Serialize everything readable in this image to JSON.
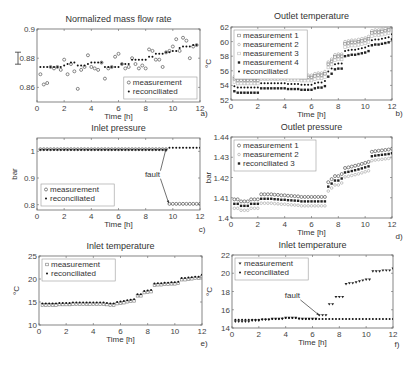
{
  "chart_data": [
    {
      "id": "a",
      "type": "scatter",
      "title": "Normalized mass flow rate",
      "xlabel": "Time [h]",
      "ylabel": "",
      "panel_label": "a)",
      "xlim": [
        0,
        12
      ],
      "ylim": [
        0.85,
        0.9
      ],
      "xticks": [
        0,
        2,
        4,
        6,
        8,
        10,
        12
      ],
      "yticks": [
        0.86,
        0.88,
        0.9
      ],
      "ytick_labels": [
        "0.86",
        "0.88",
        "0.9"
      ],
      "errorbar_marker": true,
      "legend": {
        "position": "bottom-right",
        "entries": [
          "measurement",
          "reconciliated"
        ]
      },
      "series": [
        {
          "name": "measurement",
          "marker": "open-circle",
          "x": [
            0.25,
            0.5,
            0.75,
            1.0,
            1.25,
            1.5,
            1.75,
            2.0,
            2.25,
            2.5,
            2.75,
            3.0,
            3.25,
            3.5,
            3.75,
            4.0,
            4.25,
            4.5,
            4.75,
            5.0,
            5.25,
            5.5,
            5.75,
            6.0,
            6.25,
            6.5,
            6.75,
            7.0,
            7.25,
            7.5,
            7.75,
            8.0,
            8.25,
            8.5,
            8.75,
            9.0,
            9.25,
            9.5,
            9.75,
            10.0,
            10.25,
            10.5,
            10.75,
            11.0,
            11.25,
            11.5,
            11.75
          ],
          "y": [
            0.869,
            0.862,
            0.863,
            0.874,
            0.873,
            0.874,
            0.872,
            0.879,
            0.869,
            0.876,
            0.871,
            0.859,
            0.872,
            0.874,
            0.882,
            0.874,
            0.873,
            0.872,
            0.877,
            0.866,
            0.873,
            0.874,
            0.881,
            0.883,
            0.876,
            0.873,
            0.874,
            0.88,
            0.876,
            0.873,
            0.875,
            0.873,
            0.886,
            0.885,
            0.879,
            0.879,
            0.874,
            0.884,
            0.885,
            0.888,
            0.893,
            0.885,
            0.894,
            0.892,
            0.88,
            0.888,
            0.889
          ]
        },
        {
          "name": "reconciliated",
          "marker": "filled-dot",
          "x": [
            0.25,
            0.5,
            0.75,
            1.0,
            1.25,
            1.5,
            1.75,
            2.0,
            2.25,
            2.5,
            2.75,
            3.0,
            3.25,
            3.5,
            3.75,
            4.0,
            4.25,
            4.5,
            4.75,
            5.0,
            5.25,
            5.5,
            5.75,
            6.0,
            6.25,
            6.5,
            6.75,
            7.0,
            7.25,
            7.5,
            7.75,
            8.0,
            8.25,
            8.5,
            8.75,
            9.0,
            9.25,
            9.5,
            9.75,
            10.0,
            10.25,
            10.5,
            10.75,
            11.0,
            11.25,
            11.5,
            11.75
          ],
          "y": [
            0.874,
            0.874,
            0.874,
            0.874,
            0.874,
            0.874,
            0.874,
            0.875,
            0.876,
            0.877,
            0.877,
            0.875,
            0.875,
            0.875,
            0.876,
            0.877,
            0.877,
            0.877,
            0.877,
            0.874,
            0.874,
            0.874,
            0.874,
            0.874,
            0.876,
            0.876,
            0.876,
            0.879,
            0.879,
            0.879,
            0.879,
            0.879,
            0.881,
            0.881,
            0.883,
            0.883,
            0.883,
            0.884,
            0.884,
            0.885,
            0.885,
            0.887,
            0.888,
            0.888,
            0.888,
            0.889,
            0.889
          ]
        }
      ]
    },
    {
      "id": "b",
      "type": "scatter",
      "title": "Outlet temperature",
      "xlabel": "Time [h]",
      "ylabel": "°C",
      "panel_label": "b)",
      "xlim": [
        0,
        12
      ],
      "ylim": [
        52,
        62
      ],
      "xticks": [
        0,
        2,
        4,
        6,
        8,
        10,
        12
      ],
      "yticks": [
        52,
        54,
        56,
        58,
        60,
        62
      ],
      "ytick_labels": [
        "52",
        "54",
        "56",
        "58",
        "60",
        "62"
      ],
      "legend": {
        "position": "top-left",
        "entries": [
          "measurement 1",
          "measurement 2",
          "measurement 3",
          "measurement 4",
          "reconciliated"
        ]
      },
      "series": [
        {
          "name": "measurement 1",
          "marker": "open-square",
          "offset": 1.0
        },
        {
          "name": "measurement 2",
          "marker": "open-circle-light",
          "offset": 1.3
        },
        {
          "name": "measurement 3",
          "marker": "open-square-light",
          "offset": 0.55
        },
        {
          "name": "measurement 4",
          "marker": "filled-square",
          "offset": -0.7
        },
        {
          "name": "reconciliated",
          "marker": "filled-dot",
          "offset": 0.0
        }
      ],
      "base_curve": {
        "x": [
          0.25,
          0.5,
          0.75,
          1.0,
          1.25,
          1.5,
          1.75,
          2.0,
          2.25,
          2.5,
          2.75,
          3.0,
          3.25,
          3.5,
          3.75,
          4.0,
          4.25,
          4.5,
          4.75,
          5.0,
          5.25,
          5.5,
          5.75,
          6.0,
          6.25,
          6.5,
          6.75,
          7.0,
          7.25,
          7.5,
          7.75,
          8.0,
          8.25,
          8.5,
          8.75,
          9.0,
          9.25,
          9.5,
          9.75,
          10.0,
          10.25,
          10.5,
          10.75,
          11.0,
          11.25,
          11.5,
          11.75,
          12.0
        ],
        "y": [
          53.9,
          53.7,
          53.7,
          53.7,
          53.7,
          53.7,
          53.7,
          53.7,
          54.3,
          54.3,
          54.3,
          54.3,
          54.3,
          54.3,
          54.3,
          54.3,
          54.2,
          54.2,
          54.2,
          54.2,
          54.1,
          54.1,
          54.1,
          54.1,
          54.3,
          54.4,
          54.4,
          54.6,
          55.9,
          56.3,
          56.9,
          57.0,
          57.0,
          58.7,
          58.8,
          58.9,
          58.9,
          59.0,
          59.1,
          59.2,
          59.4,
          60.2,
          60.3,
          60.3,
          60.4,
          60.5,
          60.6,
          61.0
        ]
      }
    },
    {
      "id": "c",
      "type": "scatter",
      "title": "Inlet pressure",
      "xlabel": "Time [h]",
      "ylabel": "bar",
      "panel_label": "c)",
      "xlim": [
        0,
        12
      ],
      "ylim": [
        0.78,
        1.05
      ],
      "xticks": [
        0,
        2,
        4,
        6,
        8,
        10,
        12
      ],
      "yticks": [
        0.8,
        0.9,
        1.0
      ],
      "ytick_labels": [
        "0.8",
        "0.9",
        "1"
      ],
      "legend": {
        "position": "bottom-left",
        "entries": [
          "measurement",
          "reconciliated"
        ]
      },
      "annotation": {
        "text": "fault",
        "x": 8.5,
        "y": 0.905,
        "arrows_to": [
          [
            9.5,
            1.01
          ],
          [
            9.7,
            0.805
          ]
        ]
      },
      "series": [
        {
          "name": "measurement",
          "marker": "open-circle",
          "x_range": [
            0.25,
            12.0
          ],
          "step": 0.25,
          "segments": [
            {
              "until": 9.5,
              "value": 1.008
            },
            {
              "until": 12.0,
              "value": 0.803
            }
          ]
        },
        {
          "name": "reconciliated",
          "marker": "filled-dot",
          "x_range": [
            0.25,
            12.0
          ],
          "step": 0.25,
          "segments": [
            {
              "until": 9.5,
              "value": 1.006
            },
            {
              "until": 12.0,
              "value": 1.013
            }
          ]
        }
      ]
    },
    {
      "id": "d",
      "type": "scatter",
      "title": "Outlet pressure",
      "xlabel": "Time [h]",
      "ylabel": "bar",
      "panel_label": "d)",
      "xlim": [
        0,
        12
      ],
      "ylim": [
        1.4,
        1.44
      ],
      "xticks": [
        0,
        2,
        4,
        6,
        8,
        10,
        12
      ],
      "yticks": [
        1.4,
        1.41,
        1.42,
        1.43,
        1.44
      ],
      "ytick_labels": [
        "1.4",
        "1.41",
        "1.42",
        "1.43",
        "1.44"
      ],
      "legend": {
        "position": "top-left",
        "entries": [
          "measurement 1",
          "measurement 2",
          "reconciliated 3"
        ]
      },
      "series": [
        {
          "name": "measurement 1",
          "marker": "open-circle",
          "offset": 0.0022
        },
        {
          "name": "measurement 2",
          "marker": "open-circle-light",
          "offset": -0.0022
        },
        {
          "name": "reconciliated 3",
          "marker": "filled-square",
          "offset": 0.0
        }
      ],
      "base_curve": {
        "x": [
          0.25,
          0.5,
          0.75,
          1.0,
          1.25,
          1.5,
          1.75,
          2.0,
          2.25,
          2.5,
          2.75,
          3.0,
          3.25,
          3.5,
          3.75,
          4.0,
          4.25,
          4.5,
          4.75,
          5.0,
          5.25,
          5.5,
          5.75,
          6.0,
          6.25,
          6.5,
          6.75,
          7.0,
          7.25,
          7.5,
          7.75,
          8.0,
          8.25,
          8.5,
          8.75,
          9.0,
          9.25,
          9.5,
          9.75,
          10.0,
          10.25,
          10.5,
          10.75,
          11.0,
          11.25,
          11.5,
          11.75,
          12.0
        ],
        "y": [
          1.407,
          1.407,
          1.406,
          1.406,
          1.406,
          1.407,
          1.407,
          1.407,
          1.4095,
          1.4095,
          1.4095,
          1.4095,
          1.4093,
          1.4092,
          1.409,
          1.409,
          1.4088,
          1.4087,
          1.4086,
          1.4085,
          1.4082,
          1.4082,
          1.4082,
          1.4082,
          1.4082,
          1.4082,
          1.4082,
          1.4082,
          1.4155,
          1.417,
          1.4185,
          1.4185,
          1.4195,
          1.4225,
          1.4228,
          1.4232,
          1.4236,
          1.424,
          1.4245,
          1.425,
          1.4255,
          1.4305,
          1.4308,
          1.431,
          1.4312,
          1.4314,
          1.4316,
          1.432
        ]
      }
    },
    {
      "id": "e",
      "type": "scatter",
      "title": "Inlet temperature",
      "xlabel": "Time [h]",
      "ylabel": "°C",
      "panel_label": "e)",
      "xlim": [
        0,
        12
      ],
      "ylim": [
        10,
        25
      ],
      "xticks": [
        0,
        2,
        4,
        6,
        8,
        10,
        12
      ],
      "yticks": [
        10,
        15,
        20,
        25
      ],
      "ytick_labels": [
        "10",
        "15",
        "20",
        "25"
      ],
      "legend": {
        "position": "top-left",
        "entries": [
          "measurement",
          "reconciliated"
        ]
      },
      "series": [
        {
          "name": "measurement",
          "marker": "open-square",
          "offset": -0.35
        },
        {
          "name": "reconciliated",
          "marker": "filled-dot",
          "offset": 0.0
        }
      ],
      "base_curve": {
        "x": [
          0.25,
          0.5,
          0.75,
          1.0,
          1.25,
          1.5,
          1.75,
          2.0,
          2.25,
          2.5,
          2.75,
          3.0,
          3.25,
          3.5,
          3.75,
          4.0,
          4.25,
          4.5,
          4.75,
          5.0,
          5.25,
          5.5,
          5.75,
          6.0,
          6.25,
          6.5,
          6.75,
          7.0,
          7.25,
          7.5,
          7.75,
          8.0,
          8.25,
          8.5,
          8.75,
          9.0,
          9.25,
          9.5,
          9.75,
          10.0,
          10.25,
          10.5,
          10.75,
          11.0,
          11.25,
          11.5,
          11.75,
          12.0
        ],
        "y": [
          14.7,
          14.7,
          14.7,
          14.7,
          14.7,
          14.8,
          14.8,
          14.8,
          14.8,
          14.9,
          14.9,
          14.9,
          14.9,
          14.9,
          14.9,
          14.9,
          14.9,
          14.9,
          14.9,
          14.8,
          14.7,
          14.7,
          15.0,
          15.1,
          15.2,
          15.4,
          15.5,
          15.6,
          16.7,
          16.7,
          17.4,
          17.5,
          17.6,
          19.0,
          19.1,
          19.1,
          19.2,
          19.2,
          19.3,
          19.3,
          19.4,
          20.2,
          20.2,
          20.3,
          20.4,
          20.5,
          20.5,
          20.9
        ]
      }
    },
    {
      "id": "f",
      "type": "scatter",
      "title": "Inlet temperature",
      "xlabel": "Time [h]",
      "ylabel": "°C",
      "panel_label": "f)",
      "xlim": [
        0,
        12
      ],
      "ylim": [
        14,
        22
      ],
      "xticks": [
        0,
        2,
        4,
        6,
        8,
        10,
        12
      ],
      "yticks": [
        14,
        16,
        18,
        20,
        22
      ],
      "ytick_labels": [
        "14",
        "16",
        "18",
        "20",
        "22"
      ],
      "legend": {
        "position": "top-left",
        "entries": [
          "measurement",
          "reconciliated"
        ]
      },
      "annotation": {
        "text": "fault",
        "x": 4.5,
        "y": 17.3,
        "arrows_to": [
          [
            6.5,
            15.4
          ]
        ]
      },
      "series": [
        {
          "name": "measurement",
          "marker": "filled-triangle-down",
          "x": [
            0.25,
            0.5,
            0.75,
            1.0,
            1.25,
            1.5,
            1.75,
            2.0,
            2.25,
            2.5,
            2.75,
            3.0,
            3.25,
            3.5,
            3.75,
            4.0,
            4.25,
            4.5,
            4.75,
            5.0,
            5.25,
            5.5,
            5.75,
            6.0,
            6.25,
            6.5,
            6.75,
            7.0,
            7.25,
            7.5,
            7.75,
            8.0,
            8.25,
            8.5,
            8.75,
            9.0,
            9.25,
            9.5,
            9.75,
            10.0,
            10.25,
            10.5,
            10.75,
            11.0,
            11.25,
            11.5,
            11.75,
            12.0
          ],
          "y": [
            14.7,
            14.7,
            14.7,
            14.7,
            14.7,
            14.8,
            14.8,
            14.8,
            14.9,
            14.9,
            14.9,
            15.0,
            15.0,
            15.0,
            15.0,
            15.1,
            15.1,
            15.1,
            15.1,
            15.0,
            15.0,
            15.0,
            15.0,
            15.0,
            15.0,
            15.4,
            15.4,
            15.4,
            16.6,
            16.6,
            17.4,
            17.4,
            17.4,
            18.8,
            18.9,
            18.9,
            19.0,
            19.1,
            19.2,
            19.3,
            19.3,
            20.2,
            20.2,
            20.2,
            20.3,
            20.3,
            20.3,
            20.5
          ]
        },
        {
          "name": "reconciliated",
          "marker": "filled-dot",
          "x": [
            0.25,
            0.5,
            0.75,
            1.0,
            1.25,
            1.5,
            1.75,
            2.0,
            2.25,
            2.5,
            2.75,
            3.0,
            3.25,
            3.5,
            3.75,
            4.0,
            4.25,
            4.5,
            4.75,
            5.0,
            5.25,
            5.5,
            5.75,
            6.0,
            6.25,
            6.5,
            6.75,
            7.0,
            7.25,
            7.5,
            7.75,
            8.0,
            8.25,
            8.5,
            8.75,
            9.0,
            9.25,
            9.5,
            9.75,
            10.0,
            10.25,
            10.5,
            10.75,
            11.0,
            11.25,
            11.5,
            11.75,
            12.0
          ],
          "y": [
            14.9,
            14.9,
            14.9,
            14.9,
            14.9,
            14.9,
            14.9,
            14.9,
            14.95,
            14.95,
            14.95,
            15.0,
            15.0,
            15.0,
            15.05,
            15.1,
            15.1,
            15.1,
            15.1,
            15.05,
            15.0,
            15.0,
            15.0,
            15.0,
            15.0,
            15.0,
            15.0,
            15.0,
            15.0,
            15.0,
            15.0,
            15.0,
            15.0,
            15.0,
            15.0,
            15.0,
            15.0,
            15.0,
            15.0,
            15.0,
            15.0,
            15.0,
            15.0,
            15.0,
            15.0,
            15.0,
            15.0,
            15.0
          ]
        }
      ]
    }
  ]
}
